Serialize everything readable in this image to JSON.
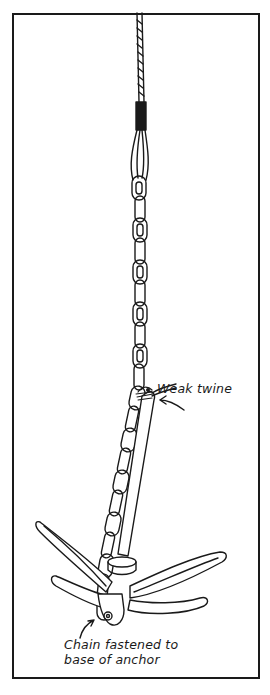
{
  "figure": {
    "labels": {
      "weak_twine": "Weak twine",
      "chain_fastened_line1": "Chain fastened to",
      "chain_fastened_line2": "base of anchor"
    },
    "colors": {
      "ink": "#1a1a1a",
      "background": "#ffffff"
    }
  }
}
